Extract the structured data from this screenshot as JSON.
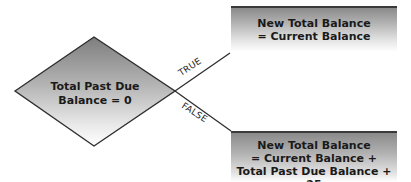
{
  "diagram": {
    "type": "flowchart",
    "decision": {
      "line1": "Total Past Due",
      "line2": "Balance = 0"
    },
    "branches": {
      "true_label": "TRUE",
      "false_label": "FALSE"
    },
    "outcome_true": {
      "line1": "New Total Balance",
      "line2": "= Current Balance"
    },
    "outcome_false": {
      "line1": "New Total Balance",
      "line2": "= Current Balance +",
      "line3": "Total Past Due Balance + 25"
    },
    "colors": {
      "stroke": "#333333",
      "fill_dark": "#8a8a8a",
      "fill_light": "#ffffff"
    }
  }
}
